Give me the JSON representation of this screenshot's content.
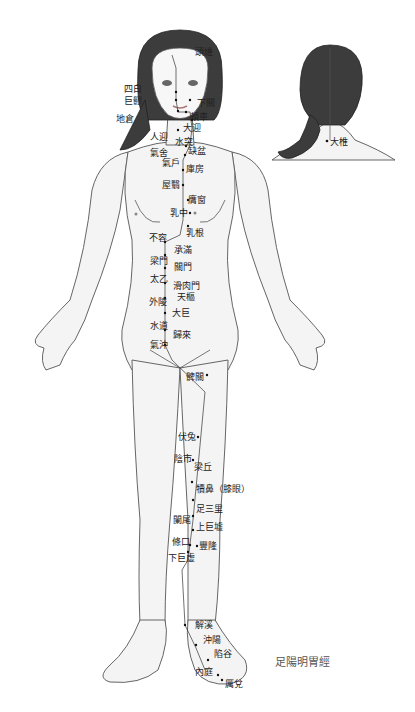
{
  "title": "足陽明胃經",
  "back_view": {
    "points": [
      {
        "name": "大椎"
      }
    ]
  },
  "front_view": {
    "points": [
      "頭維",
      "四白",
      "巨髎",
      "下關",
      "頰車",
      "地倉",
      "大迎",
      "人迎",
      "水突",
      "氣舍",
      "缺盆",
      "氣戶",
      "庫房",
      "屋翳",
      "膺窗",
      "乳中",
      "乳根",
      "不容",
      "承滿",
      "梁門",
      "關門",
      "太乙",
      "滑肉門",
      "天樞",
      "外陵",
      "大巨",
      "水道",
      "歸來",
      "氣沖",
      "髀關",
      "伏兔",
      "陰市",
      "梁丘",
      "犢鼻（膝眼）",
      "足三里",
      "闌尾",
      "上巨墟",
      "條口",
      "豐隆",
      "下巨虛",
      "解溪",
      "沖陽",
      "陷谷",
      "內庭",
      "厲兌"
    ]
  }
}
